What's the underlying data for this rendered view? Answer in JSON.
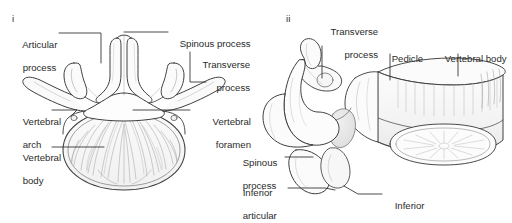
{
  "figure": {
    "background_color": "#ffffff",
    "ink_color": "#3a3a3a",
    "text_color": "#2b2b2b"
  },
  "panels": [
    {
      "id": "i",
      "name": "superior-view",
      "id_label": "i",
      "labels": [
        {
          "key": "articular_process",
          "line1": "Articular",
          "line2": "process",
          "align": "left"
        },
        {
          "key": "spinous_process",
          "line1": "Spinous process",
          "line2": "",
          "align": "left"
        },
        {
          "key": "transverse_process",
          "line1": "Transverse",
          "line2": "process",
          "align": "right"
        },
        {
          "key": "vertebral_arch",
          "line1": "Vertebral",
          "line2": "arch",
          "align": "left"
        },
        {
          "key": "vertebral_foramen",
          "line1": "Vertebral",
          "line2": "foramen",
          "align": "right"
        },
        {
          "key": "vertebral_body",
          "line1": "Vertebral",
          "line2": "body",
          "align": "left"
        }
      ]
    },
    {
      "id": "ii",
      "name": "lateral-view",
      "id_label": "ii",
      "labels": [
        {
          "key": "transverse_process",
          "line1": "Transverse",
          "line2": "process",
          "align": "right"
        },
        {
          "key": "pedicle",
          "line1": "Pedicle",
          "line2": "",
          "align": "left"
        },
        {
          "key": "vertebral_body",
          "line1": "Vertebral body",
          "line2": "",
          "align": "left"
        },
        {
          "key": "spinous_process",
          "line1": "Spinous",
          "line2": "process",
          "align": "left"
        },
        {
          "key": "inferior_articular_process",
          "line1": "Inferior",
          "line2": "articular",
          "line3": "process",
          "align": "left"
        },
        {
          "key": "inferior_articular_facet",
          "line1": "Inferior",
          "line2": "articular facet",
          "align": "left"
        }
      ]
    }
  ],
  "panel_i": {
    "id_label": "i",
    "articular_process_l1": "Articular",
    "articular_process_l2": "process",
    "spinous_process": "Spinous process",
    "transverse_process_l1": "Transverse",
    "transverse_process_l2": "process",
    "vertebral_arch_l1": "Vertebral",
    "vertebral_arch_l2": "arch",
    "vertebral_foramen_l1": "Vertebral",
    "vertebral_foramen_l2": "foramen",
    "vertebral_body_l1": "Vertebral",
    "vertebral_body_l2": "body"
  },
  "panel_ii": {
    "id_label": "ii",
    "transverse_process_l1": "Transverse",
    "transverse_process_l2": "process",
    "pedicle": "Pedicle",
    "vertebral_body": "Vertebral body",
    "spinous_process_l1": "Spinous",
    "spinous_process_l2": "process",
    "inferior_articular_process_l1": "Inferior",
    "inferior_articular_process_l2": "articular",
    "inferior_articular_process_l3": "process",
    "inferior_articular_facet_l1": "Inferior",
    "inferior_articular_facet_l2": "articular facet"
  }
}
